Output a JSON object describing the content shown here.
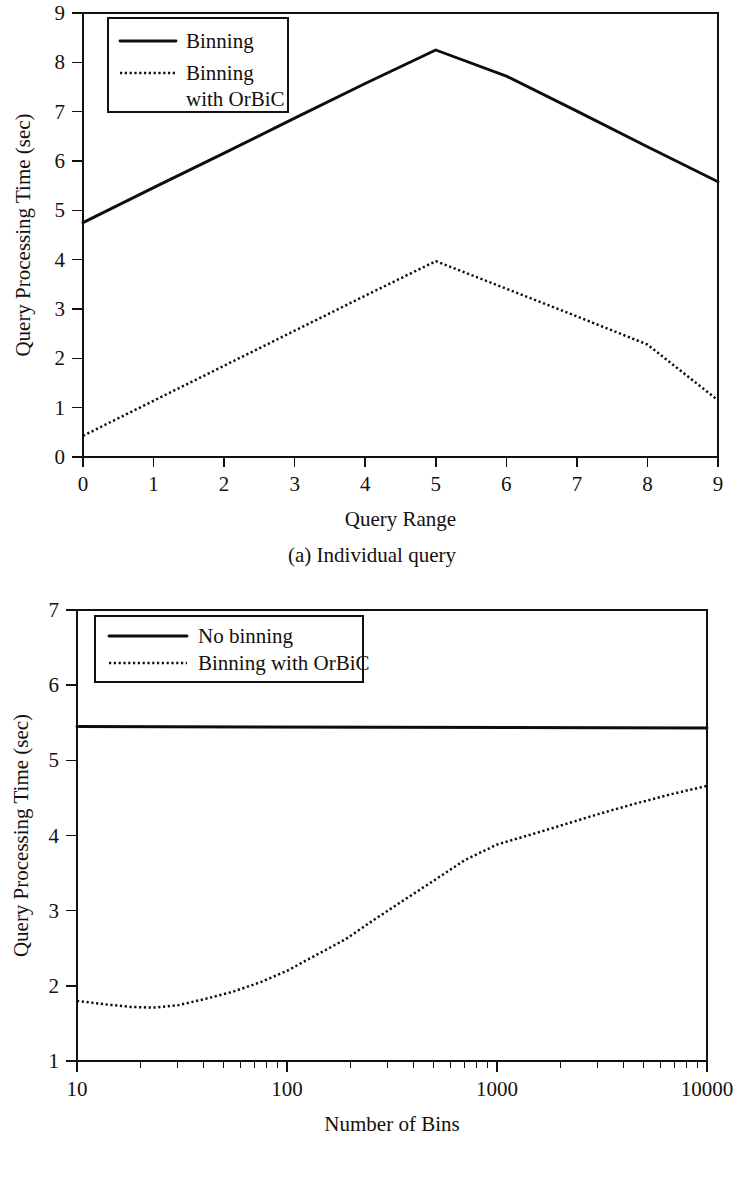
{
  "chart_data": [
    {
      "id": "individual-query",
      "type": "line",
      "title": "",
      "caption": "(a) Individual query",
      "xlabel": "Query Range",
      "ylabel": "Query Processing Time (sec)",
      "xlim": [
        0,
        9
      ],
      "ylim": [
        0,
        9
      ],
      "xscale": "linear",
      "yscale": "linear",
      "grid": false,
      "legend_position": "top-left",
      "xticks": [
        "0",
        "1",
        "2",
        "3",
        "4",
        "5",
        "6",
        "7",
        "8",
        "9"
      ],
      "yticks": [
        "0",
        "1",
        "2",
        "3",
        "4",
        "5",
        "6",
        "7",
        "8",
        "9"
      ],
      "x": [
        0,
        1,
        2,
        3,
        4,
        5,
        6,
        7,
        8,
        9
      ],
      "series": [
        {
          "name": "Binning",
          "style": "solid",
          "values": [
            4.75,
            5.46,
            6.16,
            6.87,
            7.57,
            8.25,
            7.72,
            7.01,
            6.29,
            5.58
          ]
        },
        {
          "name": "Binning with OrBiC",
          "legend_lines": [
            "Binning",
            "with OrBiC"
          ],
          "style": "dotted",
          "values": [
            0.43,
            1.14,
            1.85,
            2.56,
            3.27,
            3.97,
            3.41,
            2.85,
            2.28,
            1.15
          ]
        }
      ]
    },
    {
      "id": "average-time",
      "type": "line",
      "title": "",
      "caption": "(b) Average time",
      "xlabel": "Number of Bins",
      "ylabel": "Query Processing Time (sec)",
      "xlim": [
        10,
        10000
      ],
      "ylim": [
        1,
        7
      ],
      "xscale": "log",
      "yscale": "linear",
      "grid": false,
      "legend_position": "top-left",
      "xticks": [
        "10",
        "100",
        "1000",
        "10000"
      ],
      "yticks": [
        "1",
        "2",
        "3",
        "4",
        "5",
        "6",
        "7"
      ],
      "series": [
        {
          "name": "No binning",
          "style": "solid",
          "x": [
            10,
            10000
          ],
          "values": [
            5.45,
            5.43
          ]
        },
        {
          "name": "Binning with OrBiC",
          "style": "dotted",
          "x": [
            10,
            14,
            18,
            23,
            30,
            40,
            55,
            75,
            100,
            140,
            190,
            260,
            360,
            500,
            700,
            1000,
            1400,
            2000,
            3000,
            4500,
            7000,
            10000
          ],
          "values": [
            1.8,
            1.75,
            1.72,
            1.71,
            1.74,
            1.82,
            1.92,
            2.05,
            2.2,
            2.42,
            2.62,
            2.88,
            3.14,
            3.4,
            3.67,
            3.88,
            4.0,
            4.13,
            4.28,
            4.42,
            4.56,
            4.66
          ]
        }
      ]
    }
  ],
  "figure_a": {
    "caption": "(a) Individual query",
    "xlabel": "Query Range",
    "ylabel": "Query Processing Time (sec)",
    "legend": {
      "entry1": "Binning",
      "entry2_line1": "Binning",
      "entry2_line2": "with OrBiC"
    },
    "xticks": [
      "0",
      "1",
      "2",
      "3",
      "4",
      "5",
      "6",
      "7",
      "8",
      "9"
    ],
    "yticks": [
      "0",
      "1",
      "2",
      "3",
      "4",
      "5",
      "6",
      "7",
      "8",
      "9"
    ]
  },
  "figure_b": {
    "caption": "(b) Average time",
    "xlabel": "Number of Bins",
    "ylabel": "Query Processing Time (sec)",
    "legend": {
      "entry1": "No binning",
      "entry2": "Binning with OrBiC"
    },
    "xticks": [
      "10",
      "100",
      "1000",
      "10000"
    ],
    "yticks": [
      "1",
      "2",
      "3",
      "4",
      "5",
      "6",
      "7"
    ]
  },
  "colors": {
    "ink": "#15100d",
    "background": "#ffffff"
  }
}
